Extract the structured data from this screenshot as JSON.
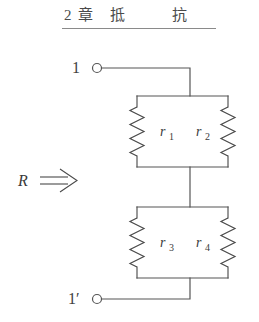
{
  "figure": {
    "title": {
      "chapter_number": "2",
      "chapter_word": "章",
      "subject_char_1": "抵",
      "subject_char_2": "抗",
      "full_text": "2章 抵 抗",
      "underline": true
    },
    "terminals": [
      {
        "id": "terminal-top",
        "label": "1",
        "position": "top-left"
      },
      {
        "id": "terminal-bottom",
        "label": "1′",
        "position": "bottom-left"
      }
    ],
    "input_label": {
      "symbol": "R",
      "arrow": "⟹",
      "meaning": "equivalent-resistance-looking-in"
    },
    "blocks": [
      {
        "id": "upper-parallel-block",
        "resistors": [
          {
            "id": "r1",
            "base": "r",
            "subscript": "1",
            "label": "r₁",
            "side": "left"
          },
          {
            "id": "r2",
            "base": "r",
            "subscript": "2",
            "label": "r₂",
            "side": "right"
          }
        ],
        "connection": "parallel"
      },
      {
        "id": "lower-parallel-block",
        "resistors": [
          {
            "id": "r3",
            "base": "r",
            "subscript": "3",
            "label": "r₃",
            "side": "left"
          },
          {
            "id": "r4",
            "base": "r",
            "subscript": "4",
            "label": "r₄",
            "side": "right"
          }
        ],
        "connection": "parallel"
      }
    ],
    "topology": "two parallel resistor pairs connected in series between terminals 1 and 1′",
    "colors": {
      "background": "#ffffff",
      "wire": "#555555",
      "text": "#3a3a3a",
      "rule": "#8a8a8a"
    }
  }
}
